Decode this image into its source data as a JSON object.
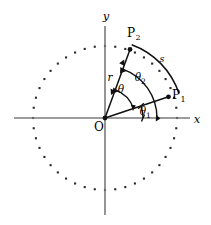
{
  "figure": {
    "background_color": "#ffffff",
    "stroke_color": "#111111",
    "axis_color": "#7a7a7a",
    "dot_color": "#2a2a2a",
    "width": 211,
    "height": 225
  },
  "axes": {
    "x_label": "x",
    "y_label": "y",
    "origin_label": "O",
    "origin": {
      "x": 105,
      "y": 118
    },
    "x_axis": {
      "x1": 14,
      "y1": 118,
      "x2": 190,
      "y2": 118
    },
    "y_axis": {
      "x1": 105,
      "y1": 26,
      "x2": 105,
      "y2": 215
    }
  },
  "circle": {
    "name": "dotted-circle",
    "center": {
      "x": 105,
      "y": 118
    },
    "radius": 72,
    "dot_count": 44,
    "dot_size": 2.1,
    "style": "dotted"
  },
  "points": [
    {
      "id": "P1",
      "label": "P",
      "subscript": "1",
      "label_x": 176,
      "label_y": 99,
      "point_x": 168,
      "point_y": 97,
      "angle_deg": 18.5,
      "radius": 66
    },
    {
      "id": "P2",
      "label": "P",
      "subscript": "2",
      "label_x": 131,
      "label_y": 37,
      "point_x": 130,
      "point_y": 48,
      "angle_deg": 70.0,
      "radius": 73
    }
  ],
  "segments": [
    {
      "name": "radius-to-p1",
      "from": "O",
      "to": "P1"
    },
    {
      "name": "radius-to-p2",
      "from": "O",
      "to": "P2"
    }
  ],
  "arcs": [
    {
      "id": "theta1",
      "label": "θ",
      "subscript": "1",
      "label_x": 143,
      "label_y": 115,
      "radius": 38,
      "start_deg": 0,
      "end_deg": 18.5
    },
    {
      "id": "theta2",
      "label": "θ",
      "subscript": "2",
      "label_x": 138,
      "label_y": 81,
      "radius": 52,
      "start_deg": 0,
      "end_deg": 70.0
    },
    {
      "id": "theta",
      "label": "θ",
      "subscript": "",
      "label_x": 121,
      "label_y": 93,
      "radius": 30,
      "start_deg": 18.5,
      "end_deg": 70.0
    },
    {
      "id": "s",
      "label": "s",
      "subscript": "",
      "label_x": 162,
      "label_y": 62,
      "radius": 78,
      "start_deg": 18.5,
      "end_deg": 70.0
    }
  ],
  "measures": [
    {
      "id": "r",
      "label": "r",
      "label_x": 110,
      "label_y": 81,
      "description": "double-headed arrow along O to P2"
    }
  ]
}
